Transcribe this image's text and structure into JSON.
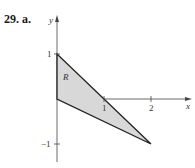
{
  "problem": {
    "label": "29. a."
  },
  "diagram": {
    "axes": {
      "x_label": "x",
      "y_label": "y"
    },
    "x_ticks": [
      "1",
      "2"
    ],
    "y_ticks": [
      "1",
      "−1"
    ],
    "region_label": "R",
    "vertices": [
      [
        0,
        1
      ],
      [
        0,
        0
      ],
      [
        2,
        -1
      ]
    ],
    "fill_color": "#d8d8d8",
    "stroke_color": "#222222"
  }
}
